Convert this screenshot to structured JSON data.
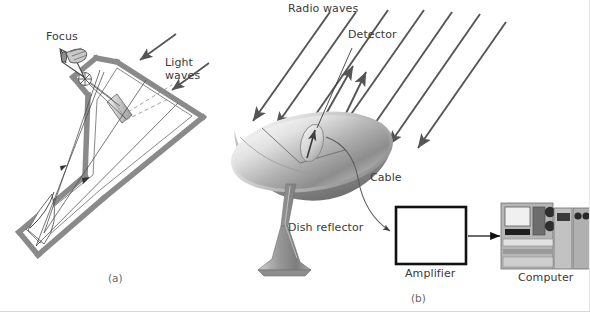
{
  "figure": {
    "background": "#ffffff",
    "label_color": "#3a3a3a",
    "caption_color": "#666666",
    "ray_color": "#555555",
    "tube_color": "#8a8a8a",
    "dish_light": "#f2f2f2",
    "dish_mid": "#bdbdbd",
    "dish_dark": "#7a7a7a",
    "box_stroke": "#111111"
  },
  "panel_a": {
    "caption": "(a)",
    "labels": {
      "focus": "Focus",
      "light_waves_line1": "Light",
      "light_waves_line2": "waves"
    },
    "parts": {
      "eyepiece": "eyepiece-at-focus",
      "primary_mirror": "concave-primary-mirror",
      "secondary_mirror": "flat-secondary-mirror",
      "tube": "telescope-tube"
    }
  },
  "panel_b": {
    "caption": "(b)",
    "labels": {
      "radio_waves": "Radio waves",
      "detector": "Detector",
      "cable": "Cable",
      "dish_reflector": "Dish reflector",
      "amplifier": "Amplifier",
      "computer": "Computer"
    },
    "parts": {
      "dish": "parabolic-dish-reflector",
      "pedestal": "dish-pedestal-mount",
      "detector_horn": "detector-feed-horn",
      "cable_curve": "signal-cable",
      "amplifier_box": "amplifier-box",
      "computer_unit": "computer-workstation"
    },
    "incoming_ray_count": 7,
    "reflected_ray_count": 2
  }
}
